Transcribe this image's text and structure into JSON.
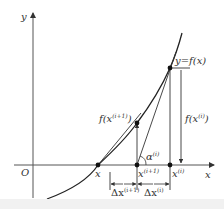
{
  "diagram": {
    "axes": {
      "x_label": "x",
      "y_label": "y",
      "origin_label": "O"
    },
    "curve_label": "y=f(x)",
    "points": {
      "root_label": "x",
      "x_i_base": "x",
      "x_i_sup": "(i)",
      "x_i1_base": "x",
      "x_i1_sup": "(i+1)"
    },
    "values": {
      "f_xi_prefix": "f(x",
      "f_xi_sup": "(i)",
      "f_xi_suffix": ")",
      "f_xi1_prefix": "f(x",
      "f_xi1_sup": "(i+1)",
      "f_xi1_suffix": ")"
    },
    "angle": {
      "base": "α",
      "sup": "(i)"
    },
    "deltas": {
      "dx_i1_base": "Δx",
      "dx_i1_sup": "(i+1)",
      "dx_i_base": "Δx",
      "dx_i_sup": "(i)"
    },
    "colors": {
      "line": "#333333",
      "axis": "#555555",
      "dot": "#111111",
      "footer": "#f1f1f1"
    }
  }
}
